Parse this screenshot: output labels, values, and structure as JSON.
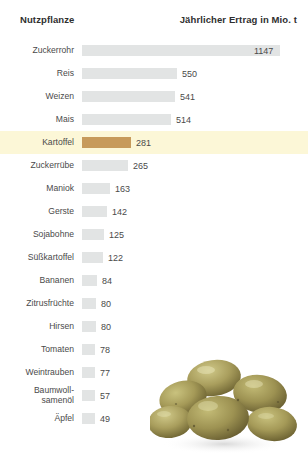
{
  "header": {
    "left_title": "Nutzpflanze",
    "right_title": "Jährlicher Ertrag in Mio. t"
  },
  "colors": {
    "bar": "#e2e4e4",
    "accent_bar": "#c79a5b",
    "highlight_row": "#fcf7d7",
    "text": "#4a4a4a",
    "header_text": "#2f2f2f",
    "background": "#ffffff"
  },
  "photo": {
    "alt": "potatoes",
    "icon": "potato-pile-image"
  },
  "chart_data": {
    "type": "bar",
    "orientation": "horizontal",
    "title": "",
    "xlabel": "Jährlicher Ertrag in Mio. t",
    "ylabel": "Nutzpflanze",
    "unit": "Mio. t",
    "grid": false,
    "legend": null,
    "xlim": [
      0,
      1147
    ],
    "highlight_category": "Kartoffel",
    "categories": [
      "Zuckerrohr",
      "Reis",
      "Weizen",
      "Mais",
      "Kartoffel",
      "Zuckerrübe",
      "Maniok",
      "Gerste",
      "Sojabohne",
      "Süßkartoffel",
      "Bananen",
      "Zitrusfrüchte",
      "Hirsen",
      "Tomaten",
      "Weintrauben",
      "Baumwoll-\nsamenöl",
      "Äpfel"
    ],
    "values": [
      1147,
      550,
      541,
      514,
      281,
      265,
      163,
      142,
      125,
      122,
      84,
      80,
      80,
      78,
      77,
      57,
      49
    ],
    "rows": [
      {
        "label": "Zuckerrohr",
        "value": 1147,
        "highlight": false,
        "label_inside": true
      },
      {
        "label": "Reis",
        "value": 550,
        "highlight": false,
        "label_inside": false
      },
      {
        "label": "Weizen",
        "value": 541,
        "highlight": false,
        "label_inside": false
      },
      {
        "label": "Mais",
        "value": 514,
        "highlight": false,
        "label_inside": false
      },
      {
        "label": "Kartoffel",
        "value": 281,
        "highlight": true,
        "label_inside": false
      },
      {
        "label": "Zuckerrübe",
        "value": 265,
        "highlight": false,
        "label_inside": false
      },
      {
        "label": "Maniok",
        "value": 163,
        "highlight": false,
        "label_inside": false
      },
      {
        "label": "Gerste",
        "value": 142,
        "highlight": false,
        "label_inside": false
      },
      {
        "label": "Sojabohne",
        "value": 125,
        "highlight": false,
        "label_inside": false
      },
      {
        "label": "Süßkartoffel",
        "value": 122,
        "highlight": false,
        "label_inside": false
      },
      {
        "label": "Bananen",
        "value": 84,
        "highlight": false,
        "label_inside": false
      },
      {
        "label": "Zitrusfrüchte",
        "value": 80,
        "highlight": false,
        "label_inside": false
      },
      {
        "label": "Hirsen",
        "value": 80,
        "highlight": false,
        "label_inside": false
      },
      {
        "label": "Tomaten",
        "value": 78,
        "highlight": false,
        "label_inside": false
      },
      {
        "label": "Weintrauben",
        "value": 77,
        "highlight": false,
        "label_inside": false
      },
      {
        "label": "Baumwoll-\nsamenöl",
        "value": 57,
        "highlight": false,
        "label_inside": false
      },
      {
        "label": "Äpfel",
        "value": 49,
        "highlight": false,
        "label_inside": false
      }
    ]
  }
}
